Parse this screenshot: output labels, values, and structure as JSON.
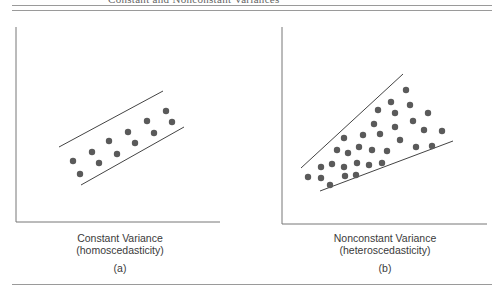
{
  "header": {
    "caption_fragment": "Constant and Nonconstant Variances"
  },
  "panels": [
    {
      "id": "a",
      "title_line1": "Constant Variance",
      "title_line2": "(homoscedasticity)",
      "tag": "(a)"
    },
    {
      "id": "b",
      "title_line1": "Nonconstant Variance",
      "title_line2": "(heteroscedasticity)",
      "tag": "(b)"
    }
  ],
  "colors": {
    "dot": "#5a5a5a",
    "line": "#444444",
    "axis": "#777777",
    "rule": "#9a9a9a"
  },
  "chart_data": [
    {
      "type": "scatter",
      "title": "Constant Variance (homoscedasticity)",
      "subtitle": "(a)",
      "xlabel": "",
      "ylabel": "",
      "grid": false,
      "note": "Points lie within a parallel band of constant width; pixel coordinates in figure space",
      "band_lines": [
        {
          "name": "upper",
          "from": [
            59,
            147
          ],
          "to": [
            163,
            91
          ]
        },
        {
          "name": "lower",
          "from": [
            81,
            185
          ],
          "to": [
            184,
            127
          ]
        }
      ],
      "points": [
        [
          73,
          161
        ],
        [
          80,
          174
        ],
        [
          92,
          152
        ],
        [
          99,
          163
        ],
        [
          109,
          141
        ],
        [
          117,
          154
        ],
        [
          128,
          132
        ],
        [
          135,
          143
        ],
        [
          147,
          121
        ],
        [
          154,
          133
        ],
        [
          166,
          111
        ],
        [
          172,
          122
        ]
      ]
    },
    {
      "type": "scatter",
      "title": "Nonconstant Variance (heteroscedasticity)",
      "subtitle": "(b)",
      "xlabel": "",
      "ylabel": "",
      "grid": false,
      "note": "Points fan out within a widening wedge; pixel coordinates in figure space",
      "band_lines": [
        {
          "name": "upper",
          "from": [
            301,
            168
          ],
          "to": [
            403,
            74
          ]
        },
        {
          "name": "lower",
          "from": [
            320,
            191
          ],
          "to": [
            453,
            141
          ]
        }
      ],
      "points": [
        [
          308,
          177
        ],
        [
          321,
          178
        ],
        [
          330,
          185
        ],
        [
          345,
          176
        ],
        [
          356,
          175
        ],
        [
          321,
          167
        ],
        [
          332,
          164
        ],
        [
          344,
          167
        ],
        [
          357,
          163
        ],
        [
          369,
          165
        ],
        [
          382,
          163
        ],
        [
          337,
          150
        ],
        [
          348,
          153
        ],
        [
          359,
          147
        ],
        [
          372,
          150
        ],
        [
          387,
          151
        ],
        [
          344,
          138
        ],
        [
          363,
          135
        ],
        [
          380,
          134
        ],
        [
          400,
          140
        ],
        [
          416,
          147
        ],
        [
          432,
          146
        ],
        [
          374,
          124
        ],
        [
          395,
          127
        ],
        [
          413,
          121
        ],
        [
          424,
          130
        ],
        [
          442,
          131
        ],
        [
          378,
          110
        ],
        [
          395,
          113
        ],
        [
          428,
          113
        ],
        [
          391,
          102
        ],
        [
          410,
          105
        ],
        [
          406,
          90
        ]
      ]
    }
  ]
}
